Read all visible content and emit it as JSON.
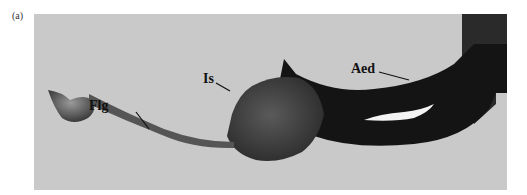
{
  "figure": {
    "panel_label": "(a)",
    "labels": {
      "flg": "Flg",
      "is": "Is",
      "aed": "Aed"
    },
    "colors": {
      "background": "#c9c9c9",
      "specimen_dark": "#1a1a1a",
      "specimen_mid": "#444444"
    }
  }
}
